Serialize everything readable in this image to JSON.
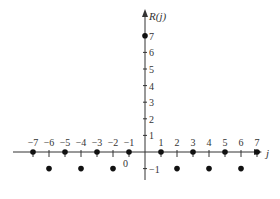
{
  "chart_data": {
    "type": "scatter",
    "title": "",
    "xlabel": "j",
    "ylabel": "R(j)",
    "x": [
      -7,
      -6,
      -5,
      -4,
      -3,
      -2,
      -1,
      0,
      1,
      2,
      3,
      4,
      5,
      6,
      7
    ],
    "values": [
      0,
      -1,
      0,
      -1,
      0,
      -1,
      0,
      7,
      0,
      -1,
      0,
      -1,
      0,
      -1,
      0
    ],
    "x_tick_labels": [
      "−7",
      "−6",
      "−5",
      "−4",
      "−3",
      "−2",
      "−1",
      "1",
      "2",
      "3",
      "4",
      "5",
      "6",
      "7"
    ],
    "y_tick_labels": [
      "1",
      "2",
      "3",
      "4",
      "5",
      "6",
      "7",
      "−1"
    ],
    "origin_label": "0",
    "xlim": [
      -7.8,
      7.6
    ],
    "ylim": [
      -1.5,
      7.9
    ],
    "grid": false,
    "legend": null,
    "marker_color": "#111111",
    "axis_color": "#333333"
  }
}
